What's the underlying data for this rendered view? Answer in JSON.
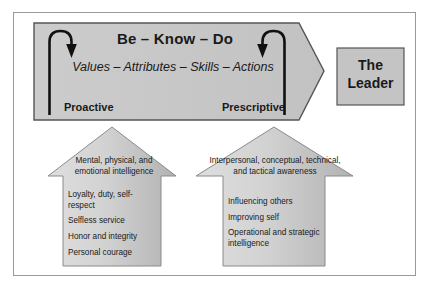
{
  "diagram": {
    "banner": {
      "title": "Be – Know – Do",
      "subtitle": "Values – Attributes – Skills – Actions",
      "left_label": "Proactive",
      "right_label": "Prescriptive"
    },
    "leader_box": {
      "line1": "The",
      "line2": "Leader",
      "text": "The Leader"
    },
    "left_arrow": {
      "head_text": "Mental, physical, and emotional intelligence",
      "items": [
        "Loyalty, duty, self-respect",
        "Selfless service",
        "Honor and integrity",
        "Personal courage"
      ]
    },
    "right_arrow": {
      "head_text": "Interpersonal, conceptual, technical, and tactical awareness",
      "items": [
        "Influencing others",
        "Improving self",
        "Operational and strategic intelligence"
      ]
    },
    "colors": {
      "banner_fill": "#c9c9c9",
      "banner_stroke": "#555555",
      "leader_fill": "#c4c4c4",
      "leader_stroke": "#555555",
      "arrow_fill_light": "#d8d8d8",
      "arrow_fill_dark": "#b8b8b8",
      "arrow_stroke": "#8a8a8a",
      "frame_stroke": "#999999",
      "text": "#1a1a1a",
      "hook_stroke": "#111111"
    }
  }
}
